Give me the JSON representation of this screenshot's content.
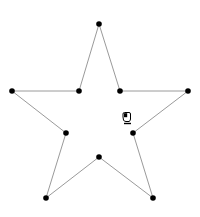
{
  "diagram": {
    "type": "polygon-editor",
    "shape": "star",
    "vertex_color": "#000000",
    "edge_color": "#9a9a9a",
    "vertices": [
      {
        "id": "v-top",
        "x": 99,
        "y": 24
      },
      {
        "id": "v-inner-upper-right",
        "x": 120,
        "y": 91
      },
      {
        "id": "v-right",
        "x": 188,
        "y": 91
      },
      {
        "id": "v-inner-right",
        "x": 133,
        "y": 133
      },
      {
        "id": "v-bottom-right",
        "x": 153,
        "y": 198
      },
      {
        "id": "v-inner-bottom",
        "x": 99,
        "y": 157
      },
      {
        "id": "v-bottom-left",
        "x": 46,
        "y": 198
      },
      {
        "id": "v-inner-left",
        "x": 66,
        "y": 133
      },
      {
        "id": "v-left",
        "x": 12,
        "y": 91
      },
      {
        "id": "v-inner-upper-left",
        "x": 79,
        "y": 91
      }
    ]
  },
  "cursor": {
    "icon": "hand-grab-icon"
  }
}
